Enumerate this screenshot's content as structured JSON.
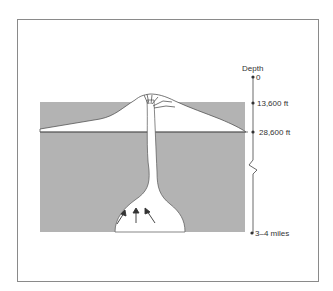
{
  "diagram": {
    "type": "volcano-cross-section",
    "depth_axis": {
      "title": "Depth",
      "markers": [
        {
          "label": "0",
          "y": 77
        },
        {
          "label": "13,600 ft",
          "y": 103
        },
        {
          "label": "28,600 ft",
          "y": 132
        },
        {
          "label": "3–4 miles",
          "y": 233
        }
      ],
      "break_symbol": "zigzag"
    },
    "colors": {
      "ground": "#b3b3b3",
      "mountain": "#ffffff",
      "outline": "#444444",
      "frame": "#8a8a8a"
    },
    "arrows_count": 3
  }
}
